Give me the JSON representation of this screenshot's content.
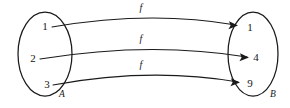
{
  "diagram": {
    "type": "function-mapping-arrow-diagram",
    "background_color": "#ffffff",
    "stroke_color": "#1a1a1a",
    "domain_set": {
      "name": "A",
      "label_x": 62,
      "label_y": 95,
      "ellipse": {
        "cx": 45,
        "cy": 54,
        "rx": 27,
        "ry": 42
      },
      "elements": [
        {
          "value": "1",
          "x": 45,
          "y": 27
        },
        {
          "value": "2",
          "x": 33,
          "y": 59
        },
        {
          "value": "3",
          "x": 47,
          "y": 85
        }
      ]
    },
    "codomain_set": {
      "name": "B",
      "label_x": 273,
      "label_y": 95,
      "ellipse": {
        "cx": 253,
        "cy": 54,
        "rx": 25,
        "ry": 42
      },
      "elements": [
        {
          "value": "1",
          "x": 250,
          "y": 28
        },
        {
          "value": "4",
          "x": 256,
          "y": 58
        },
        {
          "value": "9",
          "x": 250,
          "y": 84
        }
      ]
    },
    "mappings": [
      {
        "label": "f",
        "from": "1",
        "to": "1",
        "label_x": 141,
        "label_y": 9,
        "path": "M 52 27 Q 150 10 236 25",
        "arrowhead": {
          "x": 236,
          "y": 25,
          "angle": 12
        }
      },
      {
        "label": "f",
        "from": "2",
        "to": "4",
        "label_x": 141,
        "label_y": 40,
        "path": "M 40 59 Q 150 41 247 57",
        "arrowhead": {
          "x": 247,
          "y": 57,
          "angle": 12
        }
      },
      {
        "label": "f",
        "from": "3",
        "to": "9",
        "label_x": 141,
        "label_y": 66,
        "path": "M 53 85 Q 150 67 238 82",
        "arrowhead": {
          "x": 238,
          "y": 82,
          "angle": 12
        }
      }
    ]
  }
}
